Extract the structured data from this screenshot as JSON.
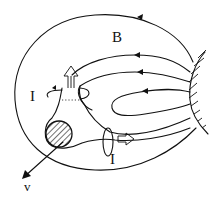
{
  "diagram": {
    "labels": {
      "field": "B",
      "current_upper": "I",
      "current_lower": "I",
      "velocity": "v"
    },
    "elements": {
      "field_lines_count": 5,
      "body": "hatched-circle",
      "wall": "hatched-boundary",
      "current_loops": 2,
      "flow_arrows": 2
    },
    "colors": {
      "ink": "#111111",
      "background": "#ffffff"
    }
  }
}
